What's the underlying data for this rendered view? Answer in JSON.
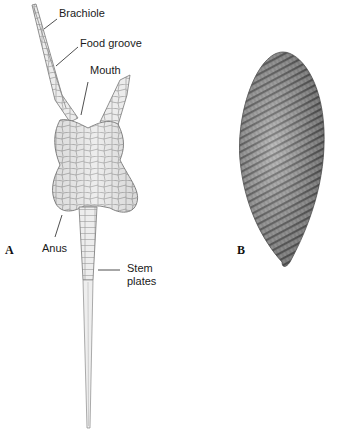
{
  "figure": {
    "panel_a": {
      "letter": "A",
      "labels": {
        "brachiole": "Brachiole",
        "food_groove": "Food groove",
        "mouth": "Mouth",
        "anus": "Anus",
        "stem_line1": "Stem",
        "stem_line2": "plates"
      }
    },
    "panel_b": {
      "letter": "B"
    },
    "colors": {
      "plate_fill": "#ececec",
      "plate_line": "#8a8a8a",
      "label_text": "#1a1a1a",
      "spiral_dark": "#6a6a6a",
      "spiral_light": "#b5b5b5"
    }
  }
}
